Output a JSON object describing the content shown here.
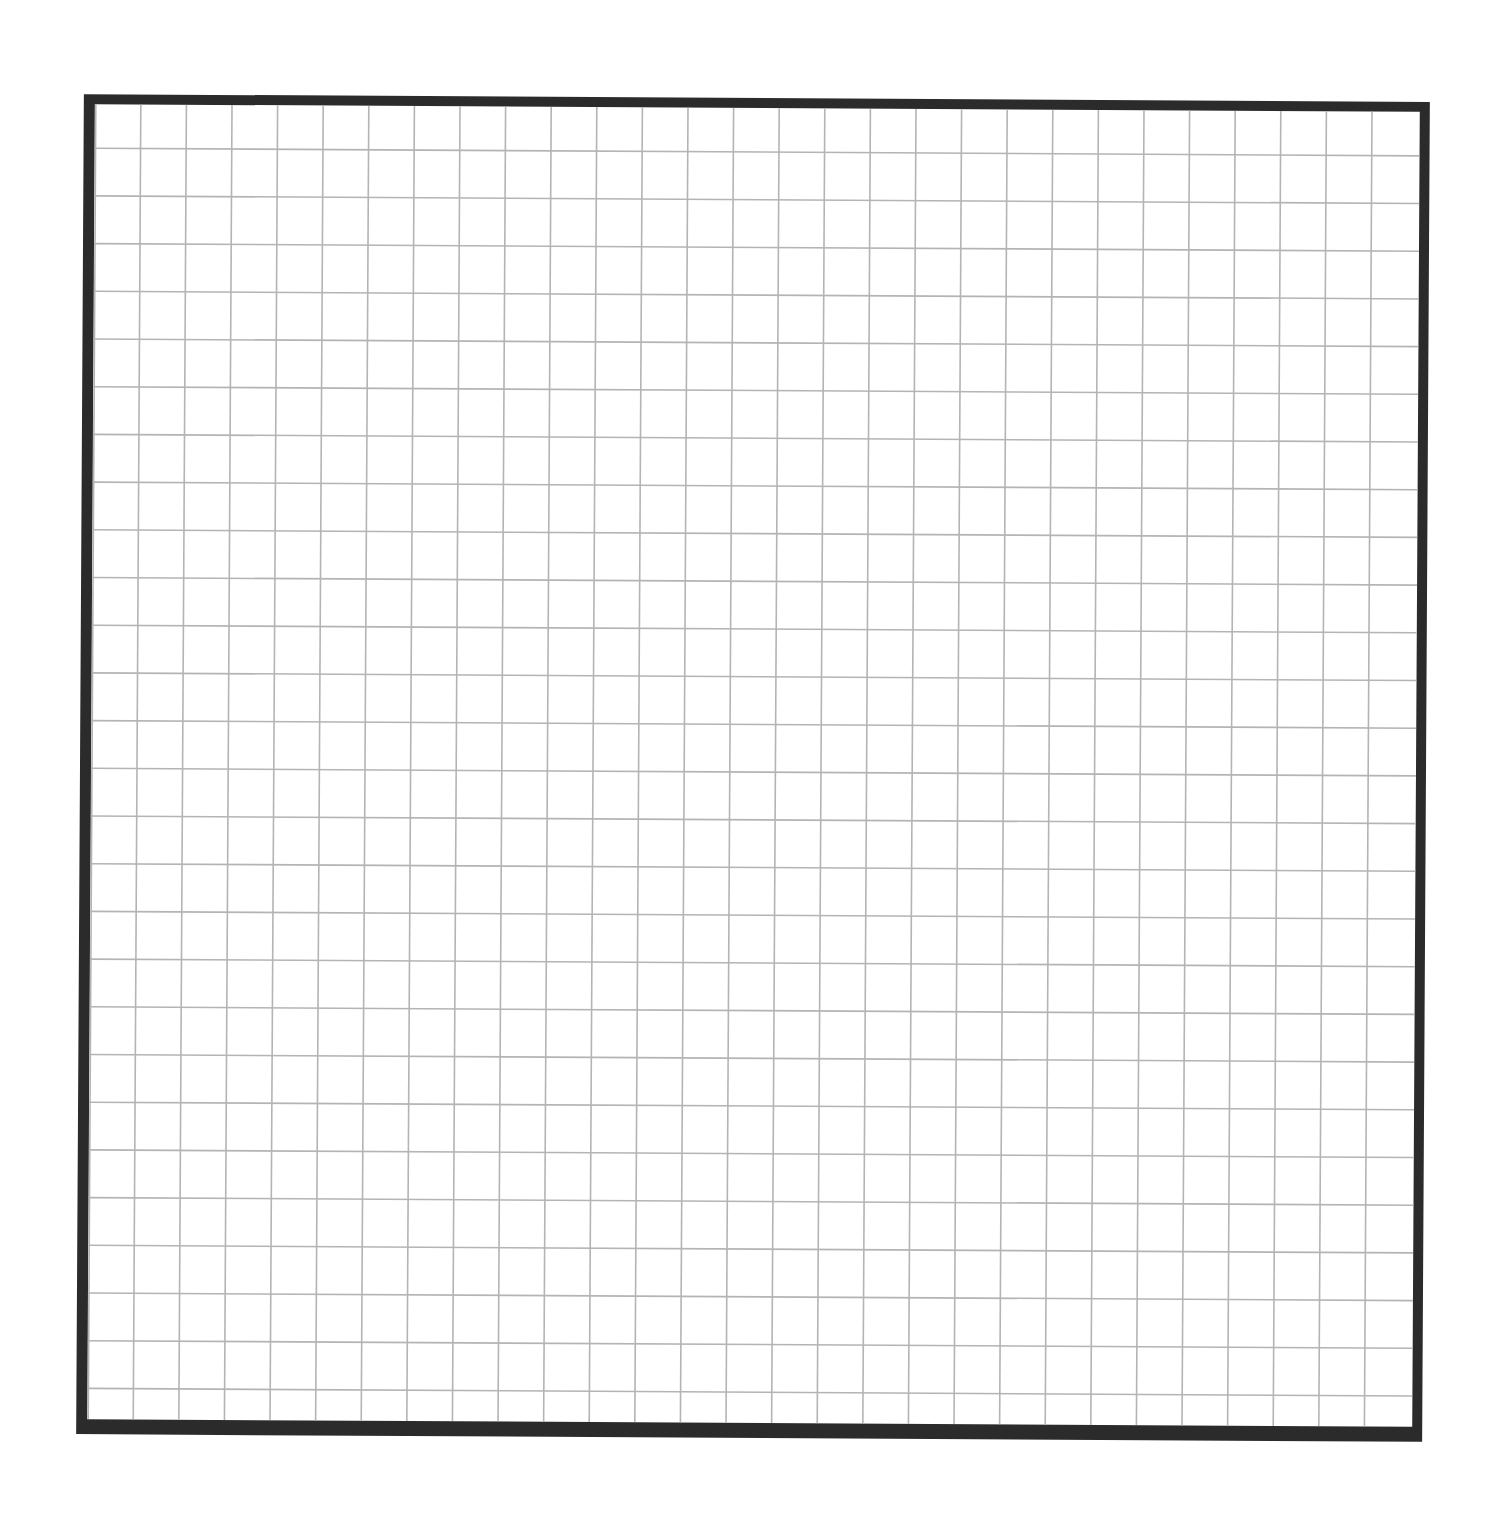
{
  "page": {
    "type": "graph-paper",
    "background_color": "#ffffff"
  },
  "grid": {
    "columns": 29,
    "rows": 28,
    "line_color": "#b4b4b4",
    "border_color": "#2b2b2b",
    "cell_width_px": 45.6,
    "cell_height_px": 47.7,
    "first_col_offset_px": 46,
    "first_row_offset_px": 44,
    "inner_left_rule": true
  }
}
